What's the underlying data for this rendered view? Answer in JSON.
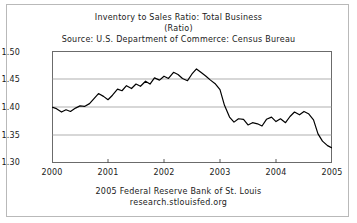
{
  "header": {
    "title": "Inventory to Sales Ratio: Total Business",
    "subtitle": "(Ratio)",
    "source": "Source: U.S. Department of Commerce: Census Bureau"
  },
  "footer": {
    "line1": "2005 Federal Reserve Bank of St. Louis",
    "line2": "research.stlouisfed.org"
  },
  "axes": {
    "y_ticks": [
      "1.50",
      "1.45",
      "1.40",
      "1.35",
      "1.30"
    ],
    "x_ticks": [
      "2000",
      "2001",
      "2002",
      "2003",
      "2004",
      "2005"
    ]
  },
  "chart_data": {
    "type": "line",
    "title": "Inventory to Sales Ratio: Total Business",
    "subtitle": "(Ratio)",
    "source": "Source: U.S. Department of Commerce: Census Bureau",
    "xlabel": "",
    "ylabel": "Ratio",
    "xlim": [
      2000.0,
      2005.0
    ],
    "ylim": [
      1.3,
      1.5
    ],
    "grid": true,
    "legend": null,
    "line_color": "#000000",
    "series": [
      {
        "name": "Inventory to Sales Ratio: Total Business",
        "x": [
          2000.0,
          2000.08,
          2000.17,
          2000.25,
          2000.33,
          2000.42,
          2000.5,
          2000.58,
          2000.67,
          2000.75,
          2000.83,
          2000.92,
          2001.0,
          2001.08,
          2001.17,
          2001.25,
          2001.33,
          2001.42,
          2001.5,
          2001.58,
          2001.67,
          2001.75,
          2001.83,
          2001.92,
          2002.0,
          2002.08,
          2002.17,
          2002.25,
          2002.33,
          2002.42,
          2002.5,
          2002.58,
          2002.67,
          2002.75,
          2002.83,
          2002.92,
          2003.0,
          2003.08,
          2003.17,
          2003.25,
          2003.33,
          2003.42,
          2003.5,
          2003.58,
          2003.67,
          2003.75,
          2003.83,
          2003.92,
          2004.0,
          2004.08,
          2004.17,
          2004.25,
          2004.33,
          2004.42,
          2004.5,
          2004.58,
          2004.67,
          2004.75,
          2004.83,
          2004.92,
          2005.0
        ],
        "y": [
          1.4,
          1.397,
          1.391,
          1.395,
          1.392,
          1.398,
          1.402,
          1.401,
          1.406,
          1.415,
          1.424,
          1.419,
          1.413,
          1.421,
          1.432,
          1.429,
          1.438,
          1.433,
          1.441,
          1.437,
          1.446,
          1.441,
          1.452,
          1.448,
          1.455,
          1.451,
          1.462,
          1.458,
          1.451,
          1.447,
          1.459,
          1.468,
          1.461,
          1.455,
          1.448,
          1.441,
          1.431,
          1.403,
          1.382,
          1.373,
          1.379,
          1.378,
          1.368,
          1.372,
          1.37,
          1.366,
          1.378,
          1.382,
          1.374,
          1.379,
          1.372,
          1.383,
          1.391,
          1.386,
          1.392,
          1.388,
          1.377,
          1.352,
          1.339,
          1.331,
          1.327
        ]
      }
    ]
  }
}
